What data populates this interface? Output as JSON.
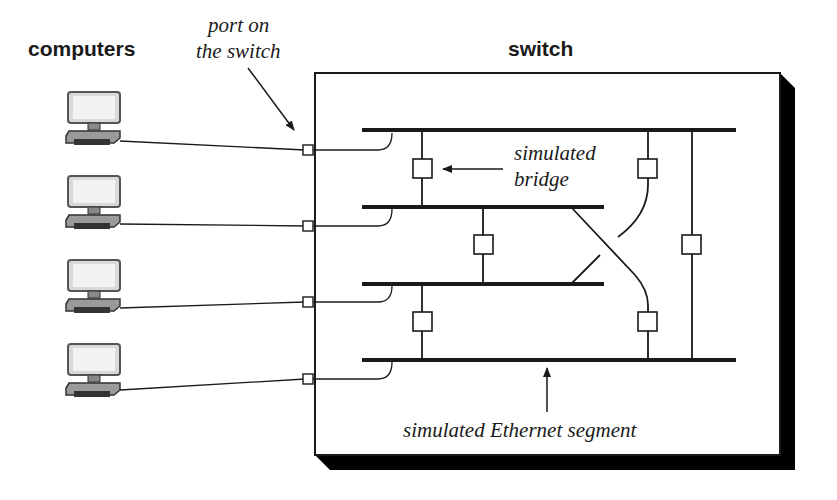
{
  "labels": {
    "computers_heading": "computers",
    "switch_heading": "switch",
    "port_label_line1": "port on",
    "port_label_line2": "the switch",
    "bridge_label_line1": "simulated",
    "bridge_label_line2": "bridge",
    "segment_label": "simulated Ethernet segment"
  },
  "computers": [
    {
      "icon": "computer-icon",
      "port": 1
    },
    {
      "icon": "computer-icon",
      "port": 2
    },
    {
      "icon": "computer-icon",
      "port": 3
    },
    {
      "icon": "computer-icon",
      "port": 4
    }
  ],
  "segments": [
    {
      "id": 1,
      "spans": "full"
    },
    {
      "id": 2,
      "spans": "partial"
    },
    {
      "id": 3,
      "spans": "partial"
    },
    {
      "id": 4,
      "spans": "full"
    }
  ],
  "bridges": [
    {
      "connects": [
        1,
        2
      ]
    },
    {
      "connects": [
        2,
        3
      ]
    },
    {
      "connects": [
        3,
        4
      ]
    },
    {
      "connects": [
        1,
        3
      ]
    },
    {
      "connects": [
        2,
        4
      ]
    },
    {
      "connects": [
        1,
        4
      ]
    }
  ],
  "colors": {
    "ink": "#1a1a1a",
    "monitor_fill": "#d9d9d9",
    "base_fill": "#9a9a9a",
    "shadow": "#000000"
  }
}
